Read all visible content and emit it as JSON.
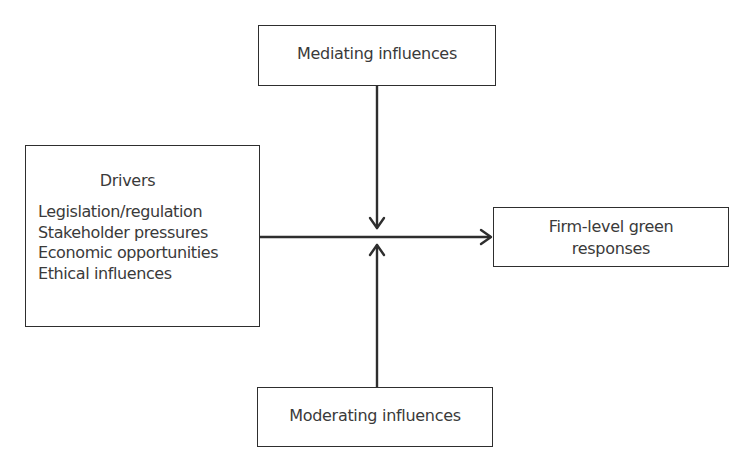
{
  "diagram": {
    "nodes": {
      "mediating": {
        "label": "Mediating influences"
      },
      "moderating": {
        "label": "Moderating influences"
      },
      "drivers": {
        "title": "Drivers",
        "items": [
          "Legislation/regulation",
          "Stakeholder pressures",
          "Economic opportunities",
          "Ethical influences"
        ]
      },
      "outcome": {
        "line1": "Firm-level green",
        "line2": "responses"
      }
    },
    "edges": [
      {
        "from": "drivers",
        "to": "outcome",
        "type": "arrow"
      },
      {
        "from": "mediating",
        "to": "drivers-outcome-link",
        "type": "arrow"
      },
      {
        "from": "moderating",
        "to": "drivers-outcome-link",
        "type": "arrow"
      }
    ],
    "colors": {
      "line": "#2e2e2e",
      "text": "#3a3a3a",
      "background": "#ffffff"
    }
  }
}
